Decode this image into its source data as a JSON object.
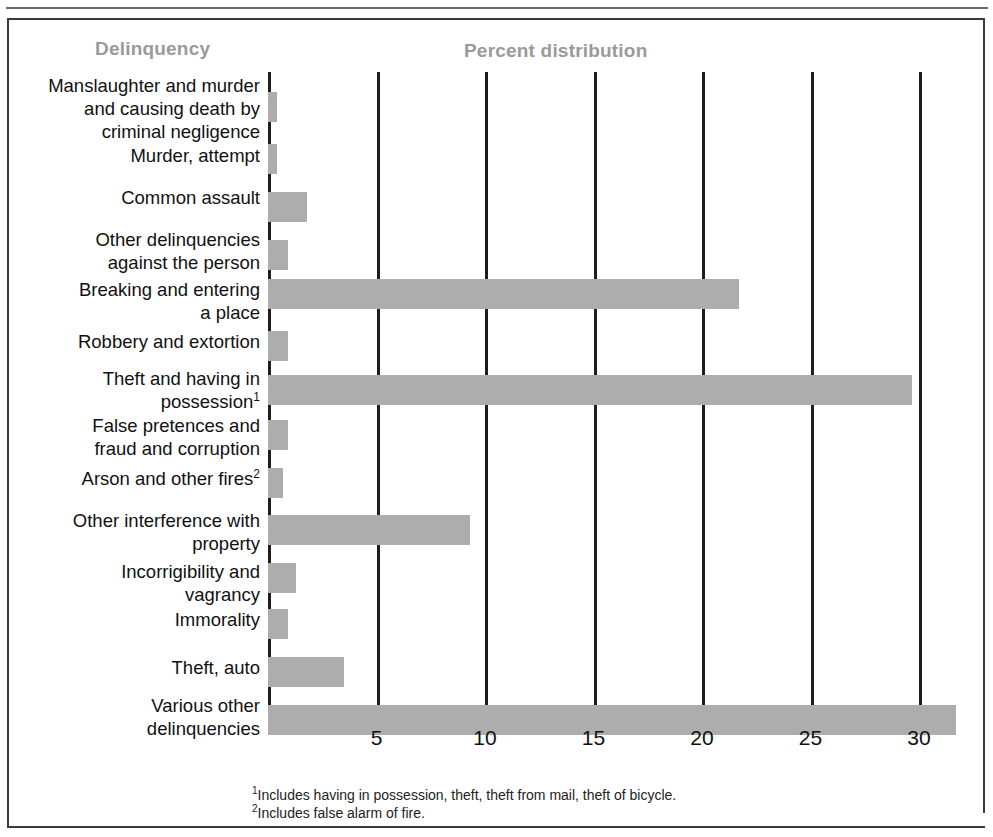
{
  "headers": {
    "category_column": "Delinquency",
    "value_column": "Percent distribution"
  },
  "footnotes": {
    "marker_1": "1",
    "text_1": "Includes having in possession, theft, theft from mail, theft of bicycle.",
    "marker_2": "2",
    "text_2": "Includes false alarm of fire."
  },
  "colors": {
    "bar": "#adadad",
    "header_text": "#9a9a9a",
    "axis": "#1d1d1d",
    "frame": "#3a3a3a",
    "label_text": "#111111"
  },
  "chart_data": {
    "type": "bar",
    "orientation": "horizontal",
    "title": "Percent distribution",
    "xlabel": "Percent distribution",
    "ylabel": "Delinquency",
    "xlim": [
      0,
      33
    ],
    "grid": true,
    "legend": "none",
    "ticks": [
      5,
      10,
      15,
      20,
      25,
      30
    ],
    "tick_labels": [
      "5",
      "10",
      "15",
      "20",
      "25",
      "30"
    ],
    "categories": [
      "Manslaughter and murder\nand causing death by\ncriminal negligence",
      "Murder, attempt",
      "Common assault",
      "Other delinquencies\nagainst the person",
      "Breaking and entering\na place",
      "Robbery and extortion",
      "Theft and having in\npossession",
      "False pretences and\nfraud and corruption",
      "Arson and other fires",
      "Other interference with\nproperty",
      "Incorrigibility and\nvagrancy",
      "Immorality",
      "Theft, auto",
      "Various other\ndelinquencies"
    ],
    "category_footnote_markers": [
      "",
      "",
      "",
      "",
      "",
      "",
      "1",
      "",
      "2",
      "",
      "",
      "",
      "",
      ""
    ],
    "values": [
      0.4,
      0.4,
      1.8,
      0.9,
      21.7,
      0.9,
      29.7,
      0.9,
      0.7,
      9.3,
      1.3,
      0.9,
      3.5,
      31.7
    ]
  }
}
